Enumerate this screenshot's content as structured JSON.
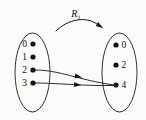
{
  "figure": {
    "type": "relation-arrow-diagram",
    "relation_label": "R",
    "relation_subscript": "1",
    "background_color": "#fcfcfa",
    "ink_color": "#141414",
    "domain": {
      "name": "left-set",
      "elements": [
        {
          "label": "0",
          "cx": 33,
          "cy": 44
        },
        {
          "label": "1",
          "cx": 33,
          "cy": 57
        },
        {
          "label": "2",
          "cx": 33,
          "cy": 70
        },
        {
          "label": "3",
          "cx": 33,
          "cy": 83
        }
      ],
      "oval": {
        "cx": 32.5,
        "cy": 72.5,
        "rx": 17.5,
        "ry": 39.5
      }
    },
    "codomain": {
      "name": "right-set",
      "elements": [
        {
          "label": "0",
          "cx": 116,
          "cy": 45
        },
        {
          "label": "2",
          "cx": 116,
          "cy": 65
        },
        {
          "label": "4",
          "cx": 116,
          "cy": 85
        }
      ],
      "oval": {
        "cx": 119.5,
        "cy": 72.5,
        "rx": 17.5,
        "ry": 39.5
      }
    },
    "pairs": [
      {
        "from": "2",
        "to": "4",
        "path": "M 35 70 C 60 70, 78 80, 114 85",
        "arrowhead_x": 75,
        "arrowhead_y": 75.8,
        "arrowhead_angle": 14
      },
      {
        "from": "3",
        "to": "4",
        "path": "M 35 83 C 58 83, 80 86, 114 85.5",
        "arrowhead_x": 74,
        "arrowhead_y": 84.6,
        "arrowhead_angle": 3
      }
    ],
    "arc": {
      "name": "relation-arc",
      "path": "M 56 31 C 68 19, 86 16, 97 24",
      "label_x": 76,
      "label_y": 14
    }
  }
}
